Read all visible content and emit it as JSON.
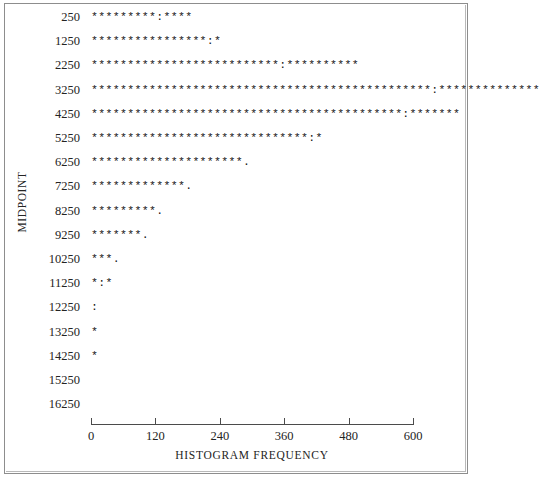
{
  "figure": {
    "ylabel": "MIDPOINT",
    "xlabel": "HISTOGRAM FREQUENCY",
    "axis_color": "#4b4b4b",
    "text_color": "#232323",
    "frame_color": "#8d8d8d"
  },
  "xaxis": {
    "ticks": [
      "0",
      "120",
      "240",
      "360",
      "480",
      "600"
    ],
    "min": 0,
    "max": 600
  },
  "chart_data": {
    "type": "bar",
    "title": "",
    "xlabel": "HISTOGRAM FREQUENCY",
    "ylabel": "MIDPOINT",
    "orientation": "horizontal",
    "xlim": [
      0,
      600
    ],
    "xticks": [
      0,
      120,
      240,
      360,
      480,
      600
    ],
    "grid": false,
    "legend": null,
    "categories": [
      "250",
      "1250",
      "2250",
      "3250",
      "4250",
      "5250",
      "6250",
      "7250",
      "8250",
      "9250",
      "10250",
      "11250",
      "12250",
      "13250",
      "14250",
      "15250",
      "16250"
    ],
    "values": [
      140,
      174,
      375,
      600,
      545,
      440,
      300,
      185,
      133,
      100,
      47,
      28,
      5,
      5,
      5,
      0,
      0
    ],
    "glyph_rows": [
      {
        "midpoint": "250",
        "glyphs": "*********:****"
      },
      {
        "midpoint": "1250",
        "glyphs": "****************:*"
      },
      {
        "midpoint": "2250",
        "glyphs": "**************************:**********"
      },
      {
        "midpoint": "3250",
        "glyphs": "***********************************************:**************"
      },
      {
        "midpoint": "4250",
        "glyphs": "*******************************************:*******"
      },
      {
        "midpoint": "5250",
        "glyphs": "******************************:*"
      },
      {
        "midpoint": "6250",
        "glyphs": "*********************."
      },
      {
        "midpoint": "7250",
        "glyphs": "*************."
      },
      {
        "midpoint": "8250",
        "glyphs": "*********."
      },
      {
        "midpoint": "9250",
        "glyphs": "*******."
      },
      {
        "midpoint": "10250",
        "glyphs": "***."
      },
      {
        "midpoint": "11250",
        "glyphs": "*:*"
      },
      {
        "midpoint": "12250",
        "glyphs": ":"
      },
      {
        "midpoint": "13250",
        "glyphs": "*"
      },
      {
        "midpoint": "14250",
        "glyphs": "*"
      },
      {
        "midpoint": "15250",
        "glyphs": ""
      },
      {
        "midpoint": "16250",
        "glyphs": ""
      }
    ]
  }
}
